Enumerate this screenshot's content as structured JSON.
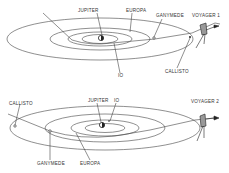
{
  "panels": [
    {
      "spacecraft": "VOYAGER 1",
      "labels": {
        "jupiter": "JUPITER",
        "europa": "EUROPA",
        "ganymede": "GANYMEDE",
        "io": "IO",
        "callisto": "CALLISTO",
        "spacecraft": "VOYAGER 1"
      }
    },
    {
      "spacecraft": "VOYAGER 2",
      "labels": {
        "jupiter": "JUPITER",
        "io": "IO",
        "callisto": "CALLISTO",
        "ganymede": "GANYMEDE",
        "europa": "EUROPA",
        "spacecraft": "VOYAGER 2"
      }
    }
  ],
  "colors": {
    "line": "#444444",
    "background": "#ffffff"
  }
}
